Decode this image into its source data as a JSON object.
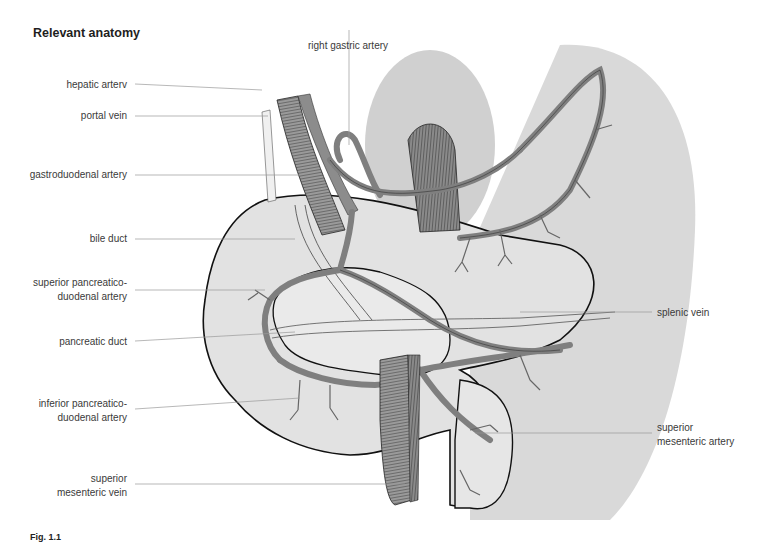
{
  "title": "Relevant anatomy",
  "figure_number": "Fig. 1.1",
  "labels": {
    "left": [
      {
        "id": "hepatic-artery",
        "lines": [
          "hepatic arterv"
        ]
      },
      {
        "id": "portal-vein",
        "lines": [
          "portal vein"
        ]
      },
      {
        "id": "gastroduodenal-artery",
        "lines": [
          "gastroduodenal artery"
        ]
      },
      {
        "id": "bile-duct",
        "lines": [
          "bile duct"
        ]
      },
      {
        "id": "superior-pancreaticoduodenal-artery",
        "lines": [
          "superior pancreatico-",
          "duodenal artery"
        ]
      },
      {
        "id": "pancreatic-duct",
        "lines": [
          "pancreatic duct"
        ]
      },
      {
        "id": "inferior-pancreaticoduodenal-artery",
        "lines": [
          "inferior pancreatico-",
          "duodenal artery"
        ]
      },
      {
        "id": "superior-mesenteric-vein",
        "lines": [
          "superior",
          "mesenteric vein"
        ]
      }
    ],
    "top": [
      {
        "id": "right-gastric-artery",
        "lines": [
          "right gastric artery"
        ]
      }
    ],
    "right": [
      {
        "id": "splenic-vein",
        "lines": [
          "splenic vein"
        ]
      },
      {
        "id": "superior-mesenteric-artery",
        "lines": [
          "superior",
          "mesenteric artery"
        ]
      }
    ]
  },
  "colors": {
    "organ_fill": "#e2e2e2",
    "background_shade": "#d6d6d6",
    "vessel_fill": "#8c8c8c",
    "vessel_dark": "#5a5a5a",
    "outline": "#111111",
    "leader_line": "#9a9a9a",
    "label_text": "#3a3a3a"
  }
}
